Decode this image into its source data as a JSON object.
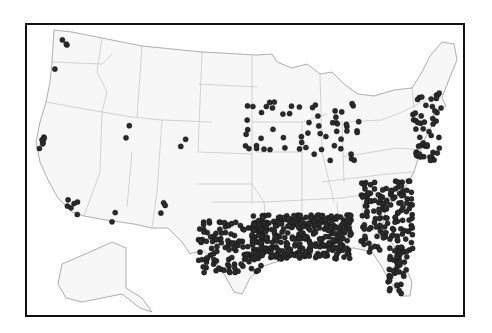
{
  "map": {
    "title": "",
    "region": "United States (contiguous + Alaska inset)",
    "marker_color": "#2a2a2a",
    "frame_color": "#111111",
    "land_color": "#f7f7f7",
    "border_color": "#b8b8b8",
    "marker_count_estimate": "~800",
    "clusters": [
      {
        "name": "Pacific Northwest",
        "x": 65,
        "y": 42,
        "count": 3
      },
      {
        "name": "Oregon coast",
        "x": 58,
        "y": 61,
        "count": 1
      },
      {
        "name": "Northern California",
        "x": 40,
        "y": 142,
        "count": 6
      },
      {
        "name": "Southern California",
        "x": 70,
        "y": 205,
        "count": 6
      },
      {
        "name": "Utah",
        "x": 128,
        "y": 128,
        "count": 2
      },
      {
        "name": "Colorado",
        "x": 183,
        "y": 140,
        "count": 2
      },
      {
        "name": "Arizona",
        "x": 115,
        "y": 213,
        "count": 2
      },
      {
        "name": "New Mexico",
        "x": 162,
        "y": 205,
        "count": 3
      },
      {
        "name": "Texas",
        "x": 230,
        "y": 245,
        "count": 120
      },
      {
        "name": "Gulf South (LA/MS/AL)",
        "x": 300,
        "y": 235,
        "count": 350
      },
      {
        "name": "Georgia / Carolinas",
        "x": 385,
        "y": 215,
        "count": 150
      },
      {
        "name": "Florida",
        "x": 395,
        "y": 270,
        "count": 40
      },
      {
        "name": "Midwest",
        "x": 300,
        "y": 130,
        "count": 60
      },
      {
        "name": "Northeast corridor",
        "x": 425,
        "y": 125,
        "count": 50
      }
    ]
  }
}
